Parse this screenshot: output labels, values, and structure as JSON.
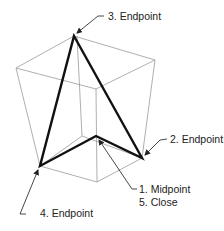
{
  "diagram": {
    "colors": {
      "box": "#9a9a9a",
      "shape": "#111111",
      "leader": "#333333",
      "text": "#222222"
    },
    "labels": {
      "endpoint3": "3. Endpoint",
      "endpoint2": "2. Endpoint",
      "midpoint1": "1. Midpoint",
      "close5": "5. Close",
      "endpoint4": "4. Endpoint"
    }
  }
}
